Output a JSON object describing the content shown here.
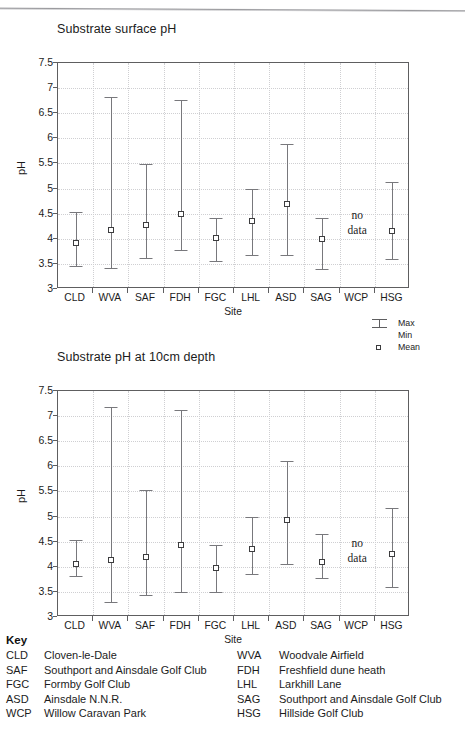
{
  "page": {
    "y_axis_title": "pH",
    "x_axis_title": "Site",
    "no_data_line1": "no",
    "no_data_line2": "data"
  },
  "legend": {
    "max_label": "Max",
    "min_label": "Min",
    "mean_label": "Mean",
    "max_icon": "error-bar-icon",
    "mean_icon": "square-marker-icon"
  },
  "key": {
    "heading": "Key",
    "entries_left": [
      {
        "code": "CLD",
        "name": "Cloven-le-Dale"
      },
      {
        "code": "SAF",
        "name": "Southport and Ainsdale Golf Club"
      },
      {
        "code": "FGC",
        "name": "Formby Golf Club"
      },
      {
        "code": "ASD",
        "name": "Ainsdale N.N.R."
      },
      {
        "code": "WCP",
        "name": "Willow Caravan Park"
      }
    ],
    "entries_right": [
      {
        "code": "WVA",
        "name": "Woodvale Airfield"
      },
      {
        "code": "FDH",
        "name": "Freshfield dune heath"
      },
      {
        "code": "LHL",
        "name": "Larkhill Lane"
      },
      {
        "code": "SAG",
        "name": "Southport and Ainsdale Golf Club"
      },
      {
        "code": "HSG",
        "name": "Hillside Golf Club"
      }
    ]
  },
  "chart_data": [
    {
      "type": "scatter",
      "id": "chart1",
      "title": "Substrate surface pH",
      "xlabel": "Site",
      "ylabel": "pH",
      "ylim": [
        3,
        7.5
      ],
      "yticks": [
        3,
        3.5,
        4,
        4.5,
        5,
        5.5,
        6,
        6.5,
        7,
        7.5
      ],
      "ytick_labels": [
        "3",
        "3.5",
        "4",
        "4.5",
        "5",
        "5.5",
        "6",
        "6.5",
        "7",
        "7.5"
      ],
      "grid": true,
      "legend_position": "right-below",
      "categories": [
        "CLD",
        "WVA",
        "SAF",
        "FDH",
        "FGC",
        "LHL",
        "ASD",
        "SAG",
        "WCP",
        "HSG"
      ],
      "series": [
        {
          "name": "Min",
          "values": [
            3.45,
            3.42,
            3.61,
            3.78,
            3.56,
            3.67,
            3.68,
            3.4,
            null,
            3.6
          ]
        },
        {
          "name": "Max",
          "values": [
            4.53,
            6.82,
            5.48,
            6.77,
            4.42,
            4.99,
            5.89,
            4.41,
            null,
            5.14
          ]
        },
        {
          "name": "Mean",
          "values": [
            3.91,
            4.18,
            4.28,
            4.5,
            4.02,
            4.36,
            4.69,
            4.0,
            null,
            4.15
          ]
        }
      ],
      "annotations": [
        {
          "category": "WCP",
          "text": "no data"
        }
      ]
    },
    {
      "type": "scatter",
      "id": "chart2",
      "title": "Substrate pH at 10cm depth",
      "xlabel": "Site",
      "ylabel": "pH",
      "ylim": [
        3,
        7.5
      ],
      "yticks": [
        3,
        3.5,
        4,
        4.5,
        5,
        5.5,
        6,
        6.5,
        7,
        7.5
      ],
      "ytick_labels": [
        "3",
        "3.5",
        "4",
        "4.5",
        "5",
        "5.5",
        "6",
        "6.5",
        "7",
        "7.5"
      ],
      "grid": true,
      "legend_position": "none",
      "categories": [
        "CLD",
        "WVA",
        "SAF",
        "FDH",
        "FGC",
        "LHL",
        "ASD",
        "SAG",
        "WCP",
        "HSG"
      ],
      "series": [
        {
          "name": "Min",
          "values": [
            3.82,
            3.3,
            3.43,
            3.49,
            3.5,
            3.86,
            4.05,
            3.78,
            null,
            3.6
          ]
        },
        {
          "name": "Max",
          "values": [
            4.54,
            7.18,
            5.53,
            7.13,
            4.44,
            5.0,
            6.1,
            4.66,
            null,
            5.17
          ]
        },
        {
          "name": "Mean",
          "values": [
            4.05,
            4.13,
            4.19,
            4.43,
            3.98,
            4.35,
            4.94,
            4.09,
            null,
            4.26
          ]
        }
      ],
      "annotations": [
        {
          "category": "WCP",
          "text": "no data"
        }
      ]
    }
  ]
}
